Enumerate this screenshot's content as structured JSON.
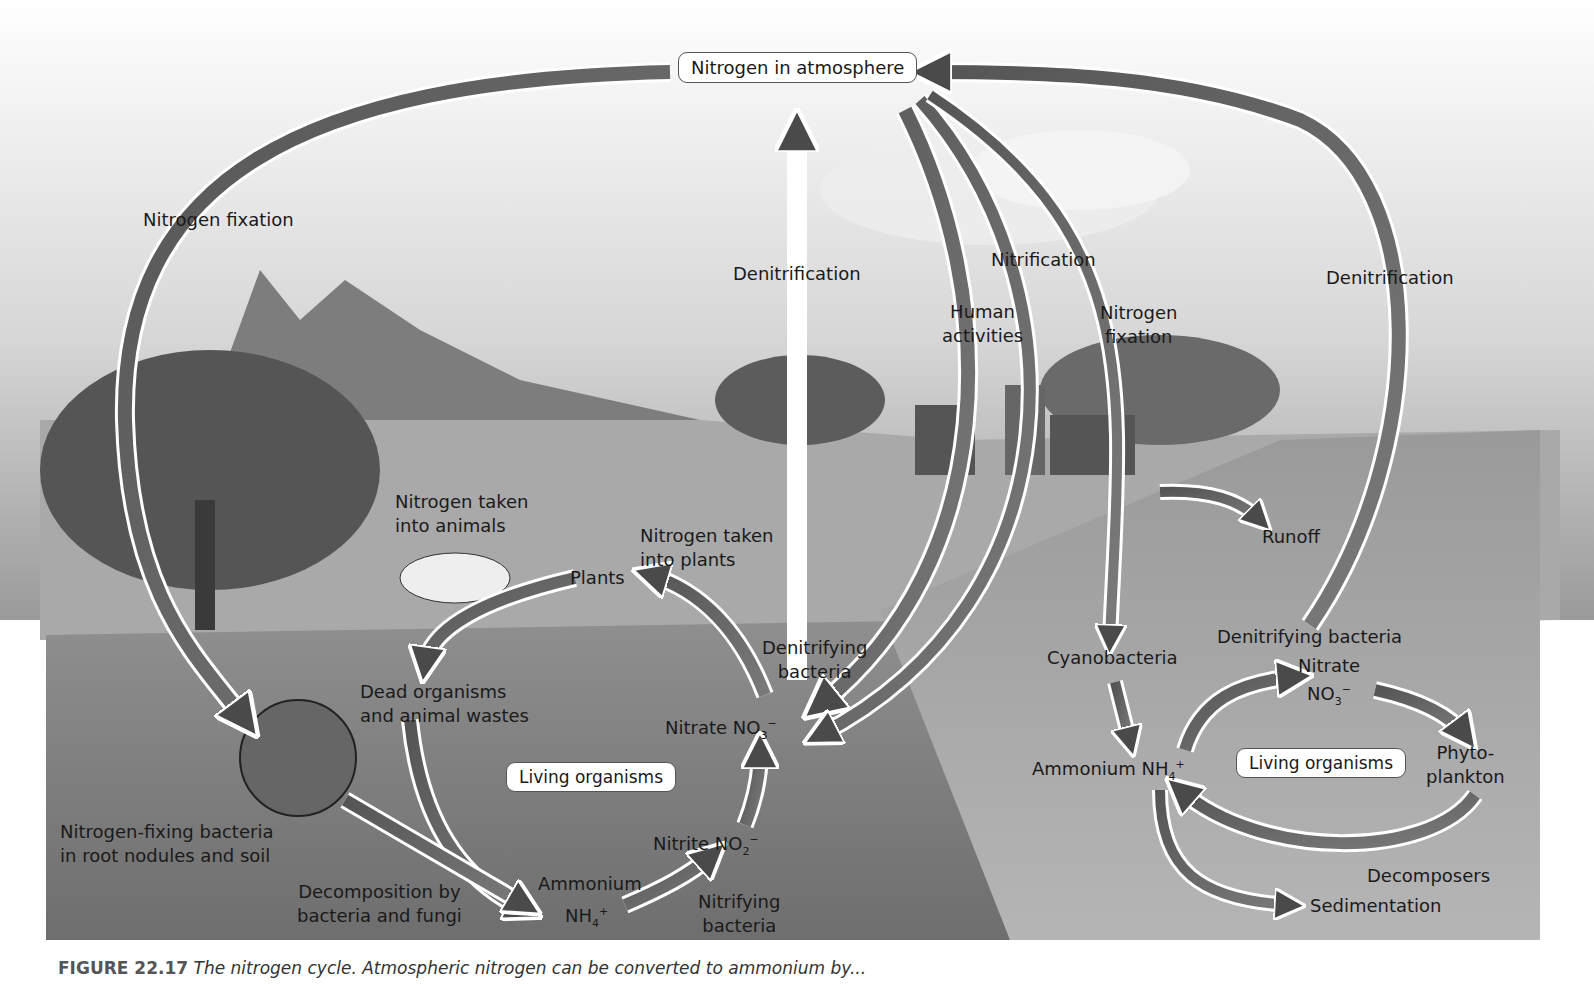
{
  "figure": {
    "boxes": {
      "atmosphere": "Nitrogen in atmosphere",
      "living_land": "Living organisms",
      "living_water": "Living organisms"
    },
    "labels": {
      "nitrogen_fixation_left": "Nitrogen fixation",
      "denitrification_center": "Denitrification",
      "nitrification": "Nitrification",
      "human_activities_1": "Human",
      "human_activities_2": "activities",
      "nitrogen_fixation_right_1": "Nitrogen",
      "nitrogen_fixation_right_2": "fixation",
      "denitrification_right": "Denitrification",
      "taken_animals_1": "Nitrogen taken",
      "taken_animals_2": "into animals",
      "taken_plants_1": "Nitrogen taken",
      "taken_plants_2": "into plants",
      "plants": "Plants",
      "dead_1": "Dead organisms",
      "dead_2": "and animal wastes",
      "denitrifying_1": "Denitrifying",
      "denitrifying_2": "bacteria",
      "nitrate_land": "Nitrate NO",
      "nitrate_sub": "3",
      "nitrate_sup": "−",
      "fixing_1": "Nitrogen-fixing bacteria",
      "fixing_2": "in root nodules and soil",
      "decomp_1": "Decomposition by",
      "decomp_2": "bacteria and fungi",
      "ammonium_land": "Ammonium",
      "nh4": "NH",
      "nh4_sub": "4",
      "nh4_sup": "+",
      "nitrite": "Nitrite NO",
      "nitrite_sub": "2",
      "nitrite_sup": "−",
      "nitrifying_1": "Nitrifying",
      "nitrifying_2": "bacteria",
      "runoff": "Runoff",
      "cyanobacteria": "Cyanobacteria",
      "denitrifying_water": "Denitrifying bacteria",
      "nitrate_water": "Nitrate",
      "no3_water": "NO",
      "ammonium_water": "Ammonium NH",
      "phyto_1": "Phyto-",
      "phyto_2": "plankton",
      "decomposers": "Decomposers",
      "sedimentation": "Sedimentation"
    },
    "caption": {
      "fig": "FIGURE 22.17",
      "text": " The nitrogen cycle. Atmospheric nitrogen can be converted to ammonium by..."
    }
  }
}
